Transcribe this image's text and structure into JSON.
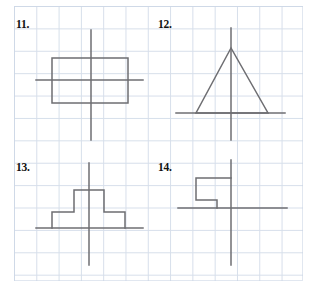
{
  "page": {
    "width": 315,
    "height": 292,
    "background": "#ffffff",
    "top_cut_text": "",
    "grid": {
      "left": 14,
      "top": 6,
      "width": 289,
      "height": 275,
      "cell_size_px": 22.3,
      "columns": 13,
      "rows": 12,
      "line_color": "#c9d4e4"
    },
    "ink_color": "#6e6e72"
  },
  "problems": [
    {
      "id": "problem-11",
      "label": "11.",
      "label_pos": {
        "x": 16,
        "y": 18
      },
      "figure": "rectangle-with-axes",
      "description": "Rectangle straddling a vertical line and a horizontal line",
      "axes": {
        "vertical": {
          "x": 91,
          "y1": 30,
          "y2": 140
        },
        "horizontal": {
          "y": 80,
          "x1": 36,
          "x2": 143
        }
      },
      "shape": {
        "type": "rectangle",
        "x": 52,
        "y": 58,
        "width": 76,
        "height": 45
      }
    },
    {
      "id": "problem-12",
      "label": "12.",
      "label_pos": {
        "x": 158,
        "y": 18
      },
      "figure": "triangle-with-axes",
      "description": "Isosceles triangle with apex on the vertical line, base on the horizontal line",
      "axes": {
        "vertical": {
          "x": 231,
          "y1": 28,
          "y2": 140
        },
        "horizontal": {
          "y": 113,
          "x1": 176,
          "x2": 285
        }
      },
      "shape": {
        "type": "triangle",
        "apex": {
          "x": 231,
          "y": 48
        },
        "base_left": {
          "x": 196,
          "y": 113
        },
        "base_right": {
          "x": 268,
          "y": 113
        }
      }
    },
    {
      "id": "problem-13",
      "label": "13.",
      "label_pos": {
        "x": 16,
        "y": 161
      },
      "figure": "stepped-pyramid-with-axes",
      "description": "Symmetric stepped pyramid sitting on the horizontal line, centered on the vertical line",
      "axes": {
        "vertical": {
          "x": 89,
          "y1": 163,
          "y2": 265
        },
        "horizontal": {
          "y": 228,
          "x1": 36,
          "x2": 143
        }
      },
      "shape": {
        "type": "polyline",
        "points": "52,228 52,212 74,212 74,190 104,190 104,212 125,212 125,228"
      }
    },
    {
      "id": "problem-14",
      "label": "14.",
      "label_pos": {
        "x": 158,
        "y": 161
      },
      "figure": "zigzag-step-with-axes",
      "description": "Z / step shaped figure in the upper-left quadrant touching the vertical line",
      "axes": {
        "vertical": {
          "x": 231,
          "y1": 160,
          "y2": 265
        },
        "horizontal": {
          "y": 208,
          "x1": 178,
          "x2": 287
        }
      },
      "shape": {
        "type": "polyline",
        "points": "231,178 196,178 196,200 217,200 217,208"
      }
    }
  ]
}
